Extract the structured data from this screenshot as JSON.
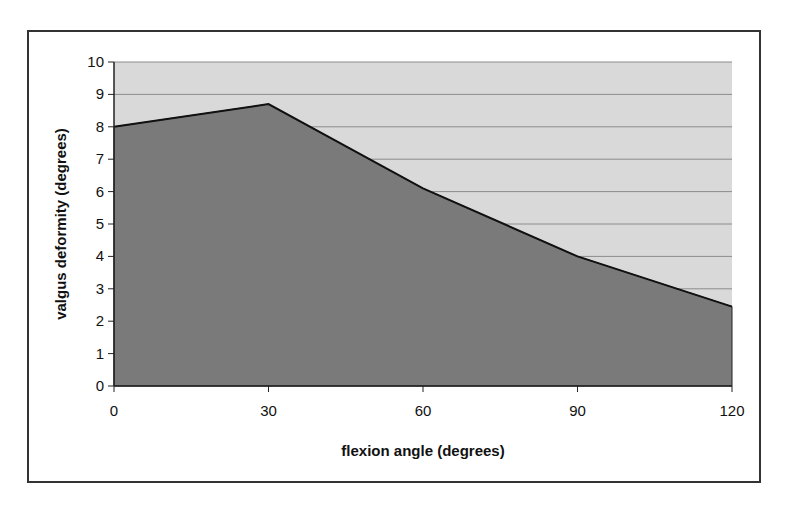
{
  "chart_data": {
    "type": "area",
    "title": "",
    "xlabel": "flexion angle (degrees)",
    "ylabel": "valgus deformity (degrees)",
    "x": [
      0,
      30,
      60,
      90,
      120
    ],
    "categories": [
      "0",
      "30",
      "60",
      "90",
      "120"
    ],
    "series": [
      {
        "name": "valgus deformity",
        "values": [
          8.0,
          8.7,
          6.1,
          4.0,
          2.45
        ]
      }
    ],
    "xlim": [
      0,
      120
    ],
    "ylim": [
      0,
      10
    ],
    "yticks": [
      0,
      1,
      2,
      3,
      4,
      5,
      6,
      7,
      8,
      9,
      10
    ],
    "xticks": [
      0,
      30,
      60,
      90,
      120
    ],
    "grid": "horizontal",
    "legend": "none",
    "colors": {
      "plot_background": "#d9d9d9",
      "area_fill": "#7a7a7a",
      "line": "#111111",
      "gridline": "#8c8c8c"
    }
  }
}
